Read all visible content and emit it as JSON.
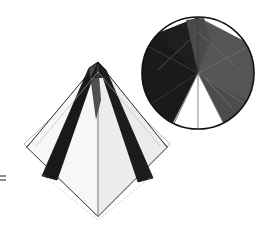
{
  "figure": {
    "background_color": "#ffffff",
    "width": 272,
    "height": 236,
    "palette": {
      "ink": "#111111",
      "dark_face": "#1c1c1c",
      "mid_face": "#4e4e4e",
      "light_face": "#f2f2f2",
      "white_face": "#ffffff",
      "hairline": "#6a6a6a",
      "faint_line": "#9a9a9a"
    },
    "tick_mark": {
      "label": "",
      "x": 3,
      "y": 178
    }
  },
  "pyramid": {
    "name": "square-pyramid-perspective",
    "apex": {
      "x": 98,
      "y": 62
    },
    "base_square": {
      "top": {
        "x": 98,
        "y": 79
      },
      "left": {
        "x": 27,
        "y": 147
      },
      "bottom": {
        "x": 98,
        "y": 216
      },
      "right": {
        "x": 167,
        "y": 147
      }
    },
    "faces": [
      {
        "name": "left-dark-edge-face",
        "shade": "#1c1c1c"
      },
      {
        "name": "right-dark-edge-face",
        "shade": "#1c1c1c"
      },
      {
        "name": "front-left-light-face",
        "shade": "#f4f4f4"
      },
      {
        "name": "front-right-light-face",
        "shade": "#ededed"
      },
      {
        "name": "apex-ridge-face",
        "shade": "#4e4e4e"
      }
    ],
    "diagonals_visible": true,
    "outline_visible": true
  },
  "circle_inset": {
    "name": "plan-view-circle",
    "center": {
      "x": 198,
      "y": 73
    },
    "radius": 56,
    "stroke": "#111111",
    "sectors": [
      {
        "name": "sector-left-dark",
        "shade": "#1f1f1f",
        "start_deg": 96,
        "end_deg": 256
      },
      {
        "name": "sector-top-mid",
        "shade": "#4a4a4a",
        "start_deg": 258,
        "end_deg": 284
      },
      {
        "name": "sector-right-mid",
        "shade": "#565656",
        "start_deg": 284,
        "end_deg": 62
      },
      {
        "name": "sector-bottom-white",
        "shade": "#ffffff",
        "start_deg": 62,
        "end_deg": 96
      }
    ],
    "apex_point": {
      "x": 198,
      "y": 32
    },
    "convergence_point": {
      "x": 198,
      "y": 73
    },
    "radial_lines": 4
  }
}
